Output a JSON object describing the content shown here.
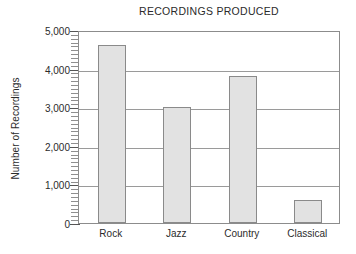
{
  "chart_data": {
    "type": "bar",
    "title": "RECORDINGS PRODUCED",
    "xlabel": "",
    "ylabel": "Number of Recordings",
    "categories": [
      "Rock",
      "Jazz",
      "Country",
      "Classical"
    ],
    "values": [
      4600,
      3000,
      3800,
      600
    ],
    "ylim": [
      0,
      5000
    ],
    "ytick_labels": [
      "0",
      "1,000",
      "2,000",
      "3,000",
      "4,000",
      "5,000"
    ],
    "ytick_values": [
      0,
      1000,
      2000,
      3000,
      4000,
      5000
    ],
    "minor_tick_interval": 100,
    "grid": "horizontal",
    "legend": "none",
    "bar_fill_color": "#e2e2e2",
    "bar_edge_color": "#8a8a8a",
    "axis_color": "#8c8c8c",
    "grid_color": "#9a9a9a",
    "text_color": "#2b2b2b"
  }
}
